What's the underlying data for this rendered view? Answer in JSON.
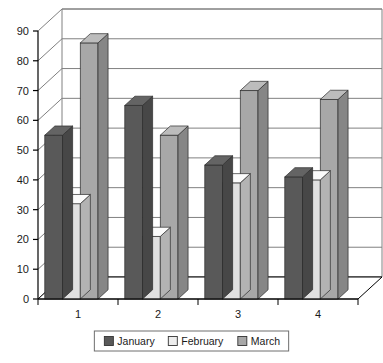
{
  "chart_data": {
    "type": "bar",
    "title": "",
    "subtitle": "",
    "xlabel": "",
    "ylabel": "",
    "categories": [
      "1",
      "2",
      "3",
      "4"
    ],
    "series": [
      {
        "name": "January",
        "values": [
          55,
          65,
          45,
          41
        ],
        "color": "#595959"
      },
      {
        "name": "February",
        "values": [
          32,
          21,
          39,
          40
        ],
        "color": "#e0e0e0"
      },
      {
        "name": "March",
        "values": [
          86,
          55,
          70,
          67
        ],
        "color": "#a8a8a8"
      }
    ],
    "ylim": [
      0,
      90
    ],
    "yticks": [
      0,
      10,
      20,
      30,
      40,
      50,
      60,
      70,
      80,
      90
    ],
    "ytick_labels": [
      "0",
      "10",
      "20",
      "30",
      "40",
      "50",
      "60",
      "70",
      "80",
      "90"
    ],
    "grid": true,
    "grid_axis": "y",
    "legend_position": "bottom",
    "legend_entries": [
      "January",
      "February",
      "March"
    ],
    "three_d": true,
    "plot_background": "#ffffff",
    "axis_color": "#000000",
    "gridline_color": "#808080"
  },
  "legend": {
    "items": [
      {
        "label": "January",
        "swatch": "#595959"
      },
      {
        "label": "February",
        "swatch": "#ededed"
      },
      {
        "label": "March",
        "swatch": "#a8a8a8"
      }
    ]
  },
  "axis": {
    "y_tick_labels": [
      "90",
      "80",
      "70",
      "60",
      "50",
      "40",
      "30",
      "20",
      "10",
      "0"
    ],
    "x_tick_labels": [
      "1",
      "2",
      "3",
      "4"
    ]
  }
}
